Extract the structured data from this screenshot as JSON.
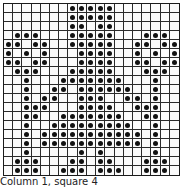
{
  "chart_data": {
    "type": "heatmap",
    "title": "",
    "caption": "Column 1, square 4",
    "grid": {
      "rows": 19,
      "cols": 19
    },
    "dot_color": "#111111",
    "line_color": "#2a2a2a",
    "rows": [
      [
        7,
        8,
        9,
        10,
        11
      ],
      [
        7,
        8,
        9,
        10,
        11
      ],
      [
        7,
        8,
        10,
        11
      ],
      [
        1,
        2,
        3,
        7,
        8,
        9,
        10,
        11,
        15,
        16,
        17
      ],
      [
        0,
        1,
        3,
        4,
        7,
        8,
        9,
        10,
        11,
        14,
        15,
        17,
        18
      ],
      [
        0,
        2,
        4,
        8,
        9,
        10,
        11,
        14,
        16,
        18
      ],
      [
        0,
        1,
        3,
        4,
        8,
        9,
        10,
        11,
        14,
        15,
        17,
        18
      ],
      [
        1,
        2,
        3,
        7,
        8,
        9,
        10,
        11,
        15,
        16,
        17
      ],
      [
        2,
        6,
        7,
        8,
        9,
        10,
        11,
        12,
        16
      ],
      [
        2,
        5,
        6,
        8,
        9,
        10,
        11,
        12,
        13,
        16
      ],
      [
        2,
        4,
        5,
        8,
        9,
        10,
        13,
        14,
        16
      ],
      [
        2,
        3,
        4,
        8,
        9,
        10,
        11,
        14,
        15,
        16
      ],
      [
        2,
        3,
        6,
        7,
        8,
        9,
        10,
        11,
        12,
        15,
        16
      ],
      [
        2,
        5,
        6,
        7,
        8,
        9,
        10,
        11,
        12,
        13,
        16
      ],
      [
        2,
        4,
        5,
        6,
        7,
        8,
        9,
        10,
        11,
        12,
        13,
        14,
        16
      ],
      [
        2,
        4,
        5,
        6,
        7,
        8,
        9,
        10,
        11,
        12,
        13,
        14,
        16
      ],
      [
        2,
        8,
        10,
        16
      ],
      [
        1,
        2,
        3,
        7,
        8,
        10,
        11,
        15,
        16,
        17
      ],
      [
        1,
        2,
        3,
        6,
        7,
        8,
        10,
        11,
        12,
        15,
        16,
        17
      ]
    ]
  },
  "caption": "Column 1, square 4"
}
